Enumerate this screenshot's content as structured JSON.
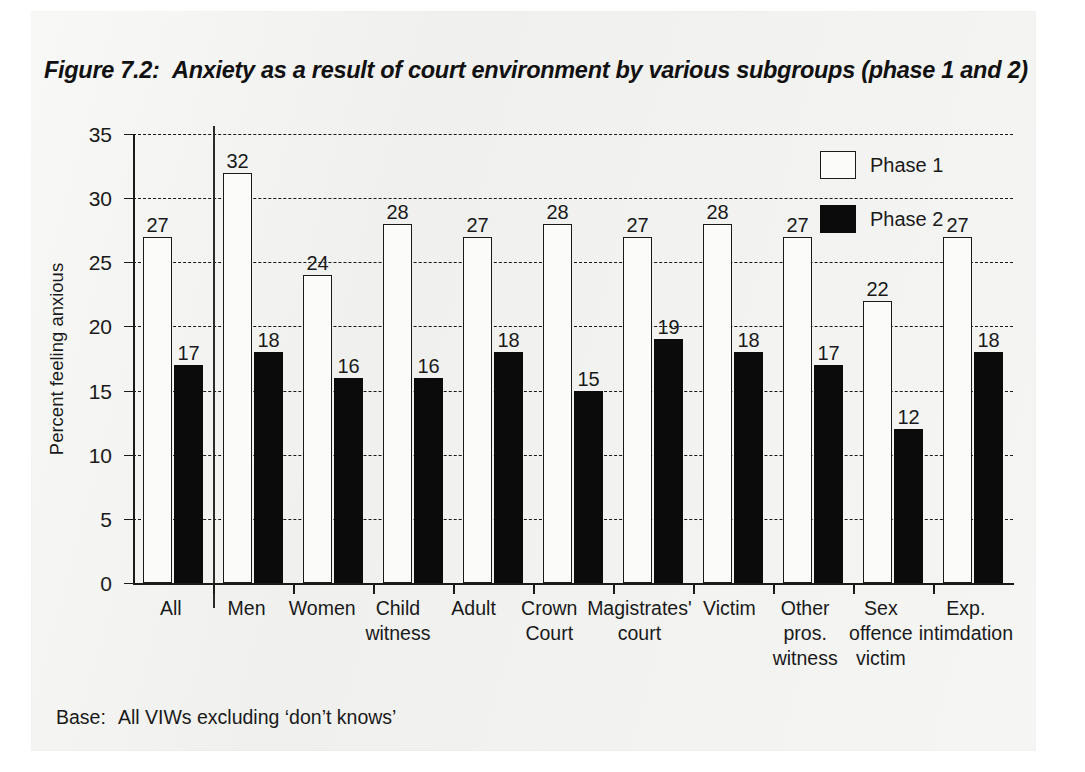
{
  "figure": {
    "number_label": "Figure 7.2:",
    "title": "Anxiety as a result of court environment by various subgroups (phase 1 and 2)",
    "base_label": "Base:",
    "base_text": "All VIWs excluding ‘don’t knows’"
  },
  "legend": {
    "position": "top-right",
    "entries": [
      {
        "label": "Phase 1",
        "swatch": "white-outlined-square",
        "color": "#ffffff"
      },
      {
        "label": "Phase 2",
        "swatch": "black-filled-square",
        "color": "#000000"
      }
    ]
  },
  "chart_data": {
    "type": "bar",
    "title": "Anxiety as a result of court environment by various subgroups (phase 1 and 2)",
    "xlabel": "",
    "ylabel": "Percent feeling anxious",
    "ylim": [
      0,
      35
    ],
    "yticks": [
      0,
      5,
      10,
      15,
      20,
      25,
      30,
      35
    ],
    "ytick_labels": [
      "0",
      "5",
      "10",
      "15",
      "20",
      "25",
      "30",
      "35"
    ],
    "grid": "horizontal-dashed",
    "categories": [
      "All",
      "Men",
      "Women",
      "Child witness",
      "Adult",
      "Crown Court",
      "Magistrates' court",
      "Victim",
      "Other pros. witness",
      "Sex offence victim",
      "Exp. intimdation"
    ],
    "category_lines": [
      [
        "All"
      ],
      [
        "Men"
      ],
      [
        "Women"
      ],
      [
        "Child",
        "witness"
      ],
      [
        "Adult"
      ],
      [
        "Crown",
        "Court"
      ],
      [
        "Magistrates'",
        "court"
      ],
      [
        "Victim"
      ],
      [
        "Other",
        "pros.",
        "witness"
      ],
      [
        "Sex",
        "offence",
        "victim"
      ],
      [
        "Exp.",
        "intimdation"
      ]
    ],
    "series": [
      {
        "name": "Phase 1",
        "color": "#ffffff",
        "values": [
          27,
          32,
          24,
          28,
          27,
          28,
          27,
          28,
          27,
          22,
          27
        ]
      },
      {
        "name": "Phase 2",
        "color": "#000000",
        "values": [
          17,
          18,
          16,
          16,
          18,
          15,
          19,
          18,
          17,
          12,
          18
        ]
      }
    ],
    "annotations": [
      {
        "text": "vertical separator after 'All' group"
      }
    ]
  }
}
